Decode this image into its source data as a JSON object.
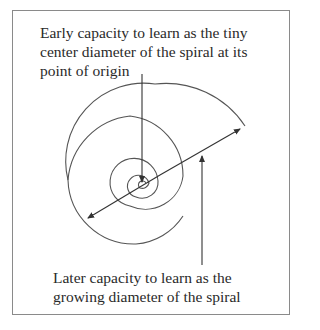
{
  "captions": {
    "top": "Early capacity to learn as the tiny center diameter of the spiral at its point of origin",
    "bottom": "Later capacity to learn as the growing diameter of the spiral"
  },
  "colors": {
    "stroke": "#444444",
    "text": "#2a2a2a",
    "frame": "#8a8a8a"
  }
}
